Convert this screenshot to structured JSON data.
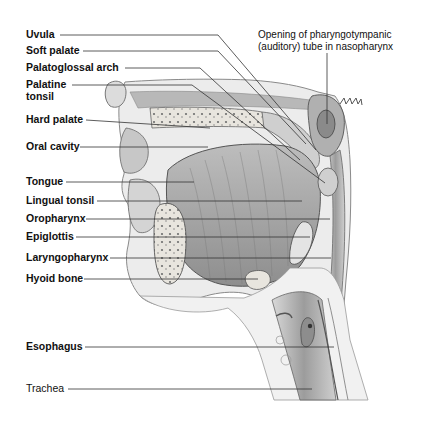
{
  "figure": {
    "colors": {
      "background": "#ffffff",
      "label_text": "#111111",
      "leader_line": "#333333",
      "tissue_light": "#d8d8d8",
      "tissue_mid": "#a8a8a8",
      "tissue_dark": "#5a5a5a",
      "bone": "#e6e3dc"
    }
  },
  "labels": {
    "uvula": "Uvula",
    "soft_palate": "Soft palate",
    "palatoglossal_arch": "Palatoglossal arch",
    "palatine_tonsil_line1": "Palatine",
    "palatine_tonsil_line2": "tonsil",
    "hard_palate": "Hard palate",
    "oral_cavity": "Oral cavity",
    "tongue": "Tongue",
    "lingual_tonsil": "Lingual tonsil",
    "oropharynx": "Oropharynx",
    "epiglottis": "Epiglottis",
    "laryngopharynx": "Laryngopharynx",
    "hyoid_bone": "Hyoid bone",
    "esophagus": "Esophagus",
    "trachea": "Trachea",
    "auditory_tube_line1": "Opening of pharyngotympanic",
    "auditory_tube_line2": "(auditory) tube in nasopharynx"
  }
}
